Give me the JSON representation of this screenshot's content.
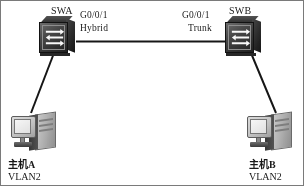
{
  "diagram": {
    "type": "network-topology",
    "line_color": "#1a1a1a",
    "background_color": "#fdfdfd"
  },
  "devices": {
    "switch_a": {
      "name": "SWA",
      "icon": "switch-icon",
      "port_label": "G0/0/1",
      "port_mode": "Hybrid"
    },
    "switch_b": {
      "name": "SWB",
      "icon": "switch-icon",
      "port_label": "G0/0/1",
      "port_mode": "Trunk"
    },
    "host_a": {
      "name": "主机A",
      "vlan": "VLAN2",
      "icon": "computer-icon"
    },
    "host_b": {
      "name": "主机B",
      "vlan": "VLAN2",
      "icon": "computer-icon"
    }
  },
  "links": [
    {
      "from": "switch_a",
      "to": "switch_b",
      "style": "solid"
    },
    {
      "from": "switch_a",
      "to": "host_a",
      "style": "solid"
    },
    {
      "from": "switch_b",
      "to": "host_b",
      "style": "solid"
    }
  ]
}
